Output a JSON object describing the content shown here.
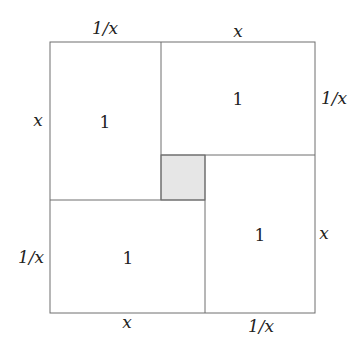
{
  "diagram": {
    "title": "",
    "regions": [
      {
        "id": "top-left",
        "area_label": "1",
        "width_label": "1/x",
        "height_label": "x"
      },
      {
        "id": "top-right",
        "area_label": "1",
        "width_label": "x",
        "height_label": "1/x"
      },
      {
        "id": "bottom-right",
        "area_label": "1",
        "width_label": "1/x",
        "height_label": "x"
      },
      {
        "id": "bottom-left",
        "area_label": "1",
        "width_label": "x",
        "height_label": "1/x"
      },
      {
        "id": "center-square",
        "area_label": "",
        "shaded": true
      }
    ],
    "labels": {
      "top_left_width": "1/x",
      "top_right_width": "x",
      "left_upper_height": "x",
      "left_lower_height": "1/x",
      "right_upper_height": "1/x",
      "right_lower_height": "x",
      "bottom_left_width": "x",
      "bottom_right_width": "1/x",
      "area_top_left": "1",
      "area_top_right": "1",
      "area_bottom_left": "1",
      "area_bottom_right": "1"
    },
    "colors": {
      "stroke": "#6e6e6e",
      "shade": "#e6e6e6",
      "background": "#ffffff"
    }
  }
}
